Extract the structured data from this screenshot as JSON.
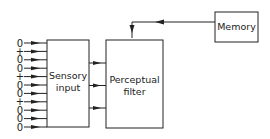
{
  "diagram": {
    "boxes": {
      "sensory": {
        "line1": "Sensory",
        "line2": "input"
      },
      "filter": {
        "line1": "Perceptual",
        "line2": "filter"
      },
      "memory": {
        "label": "Memory"
      }
    },
    "inputs": [
      "0",
      "+",
      "0",
      "0",
      "+",
      "0",
      "0",
      "+",
      "0",
      "0",
      "0"
    ],
    "sensory_to_filter_arrows": 3,
    "edges": [
      {
        "from": "inputs",
        "to": "sensory"
      },
      {
        "from": "sensory",
        "to": "filter"
      },
      {
        "from": "memory",
        "to": "filter"
      }
    ]
  }
}
